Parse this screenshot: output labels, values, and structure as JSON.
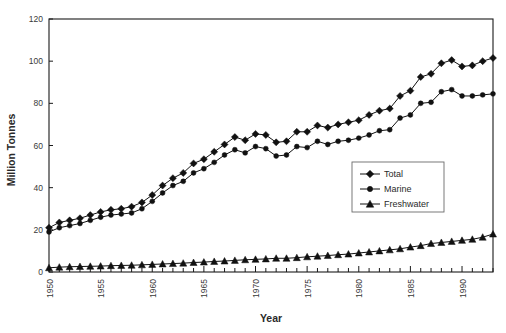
{
  "chart_data": {
    "type": "line",
    "title": "",
    "xlabel": "Year",
    "ylabel": "Million Tonnes",
    "xlim": [
      1950,
      1993
    ],
    "ylim": [
      0,
      120
    ],
    "yticks": [
      0,
      20,
      40,
      60,
      80,
      100,
      120
    ],
    "xticks": [
      1950,
      1955,
      1960,
      1965,
      1970,
      1975,
      1980,
      1985,
      1990
    ],
    "xtick_labels": [
      "1950",
      "1955",
      "1960",
      "1965",
      "1970",
      "1975",
      "1980",
      "1985",
      "1990"
    ],
    "ytick_labels": [
      "0",
      "20",
      "40",
      "60",
      "80",
      "100",
      "120"
    ],
    "grid": false,
    "legend_position": "center-right",
    "x": [
      1950,
      1951,
      1952,
      1953,
      1954,
      1955,
      1956,
      1957,
      1958,
      1959,
      1960,
      1961,
      1962,
      1963,
      1964,
      1965,
      1966,
      1967,
      1968,
      1969,
      1970,
      1971,
      1972,
      1973,
      1974,
      1975,
      1976,
      1977,
      1978,
      1979,
      1980,
      1981,
      1982,
      1983,
      1984,
      1985,
      1986,
      1987,
      1988,
      1989,
      1990,
      1991,
      1992,
      1993
    ],
    "series": [
      {
        "name": "Total",
        "marker": "diamond",
        "color": "#111111",
        "values": [
          21.0,
          23.5,
          24.5,
          25.5,
          27.0,
          28.5,
          29.5,
          30.0,
          31.0,
          33.0,
          36.5,
          41.0,
          44.5,
          47.0,
          51.5,
          53.5,
          57.0,
          60.5,
          64.0,
          62.5,
          65.5,
          65.0,
          61.5,
          62.0,
          66.5,
          66.5,
          69.5,
          68.5,
          70.0,
          71.0,
          72.0,
          74.5,
          76.5,
          77.5,
          83.5,
          86.0,
          92.5,
          94.0,
          99.0,
          100.5,
          97.5,
          98.0,
          100.0,
          101.5
        ]
      },
      {
        "name": "Marine",
        "marker": "circle",
        "color": "#111111",
        "values": [
          19.0,
          21.0,
          22.0,
          23.0,
          24.5,
          26.0,
          27.0,
          27.5,
          28.0,
          30.0,
          33.5,
          37.5,
          41.0,
          43.0,
          47.0,
          49.0,
          52.0,
          55.5,
          58.0,
          56.5,
          59.5,
          58.5,
          55.0,
          55.5,
          59.5,
          59.0,
          62.0,
          60.5,
          62.0,
          62.5,
          63.5,
          65.0,
          67.0,
          67.5,
          73.0,
          74.5,
          80.0,
          80.5,
          85.5,
          86.5,
          83.5,
          83.5,
          84.0,
          84.5
        ]
      },
      {
        "name": "Freshwater",
        "marker": "triangle",
        "color": "#111111",
        "values": [
          2.0,
          2.3,
          2.5,
          2.6,
          2.7,
          2.8,
          3.0,
          3.1,
          3.2,
          3.4,
          3.6,
          3.8,
          4.0,
          4.2,
          4.5,
          4.7,
          5.0,
          5.2,
          5.5,
          5.8,
          6.0,
          6.2,
          6.5,
          6.5,
          6.8,
          7.2,
          7.5,
          7.8,
          8.2,
          8.5,
          9.0,
          9.5,
          10.0,
          10.5,
          11.0,
          11.8,
          12.5,
          13.5,
          14.0,
          14.5,
          15.0,
          15.5,
          16.5,
          18.0
        ]
      }
    ]
  },
  "legend": {
    "entries": [
      {
        "label": "Total",
        "marker": "diamond"
      },
      {
        "label": "Marine",
        "marker": "circle"
      },
      {
        "label": "Freshwater",
        "marker": "triangle"
      }
    ]
  }
}
